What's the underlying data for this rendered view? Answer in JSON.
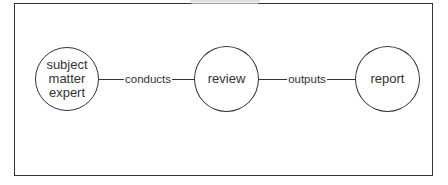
{
  "diagram": {
    "nodes": [
      {
        "id": "sme",
        "label": "subject matter expert",
        "lines": [
          "subject",
          "matter",
          "expert"
        ]
      },
      {
        "id": "review",
        "label": "review"
      },
      {
        "id": "report",
        "label": "report"
      }
    ],
    "edges": [
      {
        "from": "subject matter expert",
        "to": "review",
        "label": "conducts"
      },
      {
        "from": "review",
        "to": "report",
        "label": "outputs"
      }
    ]
  }
}
